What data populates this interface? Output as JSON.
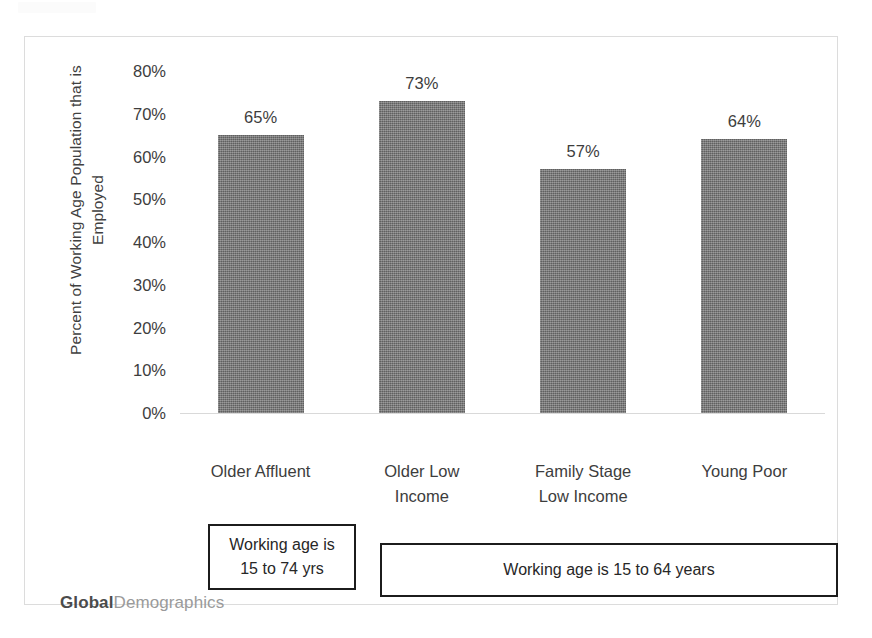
{
  "chart_data": {
    "type": "bar",
    "title": "",
    "xlabel": "",
    "ylabel": "Percent of Working Age Population that is Employed",
    "ylim": [
      0,
      80
    ],
    "grid": false,
    "legend": "none",
    "categories": [
      "Older Affluent",
      "Older Low\nIncome",
      "Family Stage\nLow Income",
      "Young Poor"
    ],
    "values": [
      65,
      73,
      57,
      64
    ],
    "value_labels": [
      "65%",
      "73%",
      "57%",
      "64%"
    ],
    "ytick_labels": [
      "80%",
      "70%",
      "60%",
      "50%",
      "40%",
      "30%",
      "20%",
      "10%",
      "0%"
    ],
    "ytick_values": [
      80,
      70,
      60,
      50,
      40,
      30,
      20,
      10,
      0
    ],
    "bar_color": "#767676",
    "annotations": [
      {
        "id": "working-age-74",
        "text": "Working age is\n15 to 74 yrs",
        "applies_to": [
          "Older Affluent"
        ]
      },
      {
        "id": "working-age-64",
        "text": "Working age is 15 to 64 years",
        "applies_to": [
          "Older Low Income",
          "Family Stage Low Income",
          "Young Poor"
        ]
      }
    ]
  },
  "ylabel_lines": [
    "Percent of Working Age Population that is",
    "Employed"
  ],
  "footer": {
    "brand_primary": "Global",
    "brand_secondary": "Demographics"
  }
}
